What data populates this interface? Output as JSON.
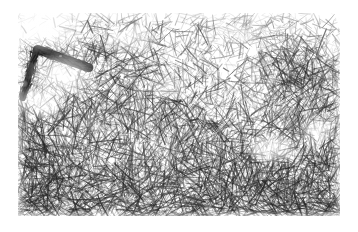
{
  "page": {
    "width": 358,
    "height": 232,
    "background_color": "#ffffff",
    "content_type": "scientific-micrograph",
    "has_text_labels": false,
    "has_scale_bar": false,
    "caption": ""
  },
  "micrograph": {
    "name": "fibrous-network-micrograph",
    "modality": "transmission-electron-micrograph",
    "subject": "dense entangled nanofibril network",
    "color_mode": "grayscale",
    "frame": {
      "x": 18,
      "y": 13,
      "width": 322,
      "height": 203
    },
    "palette": {
      "background": "#ffffff",
      "fiber_light": "#b9b9b9",
      "fiber_mid": "#7d7d7d",
      "fiber_dark": "#3c3c3c",
      "fiber_darkest": "#1c1c1c",
      "void_white": "#fdfdfd",
      "paper": "#ffffff"
    },
    "texture": {
      "fiber_count_base": 2600,
      "fiber_count_fine": 5200,
      "fiber_length_min": 4,
      "fiber_length_max": 26,
      "fiber_width_min": 0.45,
      "fiber_width_max": 1.35,
      "random_seed": 20240917,
      "density_gradient": "sparse-top to dense-bottom",
      "dominant_orientation_top": "isotropic",
      "dominant_orientation_bottom": "sub-horizontal"
    },
    "density_field": [
      {
        "name": "top-left-void",
        "cx": 0.09,
        "cy": 0.07,
        "rx": 0.13,
        "ry": 0.13,
        "density": 0.12
      },
      {
        "name": "left-upper-void",
        "cx": 0.14,
        "cy": 0.3,
        "rx": 0.11,
        "ry": 0.12,
        "density": 0.22
      },
      {
        "name": "left-mid-void",
        "cx": 0.07,
        "cy": 0.44,
        "rx": 0.08,
        "ry": 0.09,
        "density": 0.25
      },
      {
        "name": "upper-mid-void",
        "cx": 0.36,
        "cy": 0.13,
        "rx": 0.1,
        "ry": 0.08,
        "density": 0.4
      },
      {
        "name": "upper-right-void",
        "cx": 0.7,
        "cy": 0.1,
        "rx": 0.09,
        "ry": 0.07,
        "density": 0.45
      },
      {
        "name": "center-void",
        "cx": 0.47,
        "cy": 0.37,
        "rx": 0.07,
        "ry": 0.07,
        "density": 0.52
      },
      {
        "name": "right-lower-void",
        "cx": 0.79,
        "cy": 0.67,
        "rx": 0.09,
        "ry": 0.08,
        "density": 0.38
      },
      {
        "name": "right-edge-void",
        "cx": 0.93,
        "cy": 0.58,
        "rx": 0.06,
        "ry": 0.07,
        "density": 0.45
      },
      {
        "name": "dense-bottom-left",
        "cx": 0.22,
        "cy": 0.88,
        "rx": 0.25,
        "ry": 0.18,
        "density": 1.0
      },
      {
        "name": "dense-bottom-right",
        "cx": 0.68,
        "cy": 0.9,
        "rx": 0.3,
        "ry": 0.16,
        "density": 0.95
      },
      {
        "name": "dense-mid-right",
        "cx": 0.88,
        "cy": 0.3,
        "rx": 0.16,
        "ry": 0.2,
        "density": 0.88
      }
    ],
    "features": [
      {
        "name": "dark-fiber-bundle",
        "description": "prominent dark elongated fibril bundle, upper-left",
        "x1": 0.06,
        "y1": 0.18,
        "x2": 0.22,
        "y2": 0.27,
        "thickness": 9,
        "color": "#262626"
      },
      {
        "name": "dark-bundle-tail",
        "description": "darker tapering tail descending to left margin",
        "x1": 0.055,
        "y1": 0.19,
        "x2": 0.015,
        "y2": 0.42,
        "thickness": 6,
        "color": "#333333"
      }
    ]
  }
}
